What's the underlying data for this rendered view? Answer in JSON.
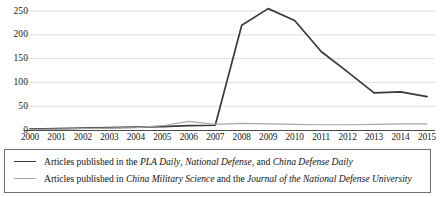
{
  "chart_data": {
    "type": "line",
    "title": "",
    "subtitle": "",
    "xlabel": "",
    "ylabel": "",
    "x": [
      2000,
      2001,
      2002,
      2003,
      2004,
      2005,
      2006,
      2007,
      2008,
      2009,
      2010,
      2011,
      2012,
      2013,
      2014,
      2015
    ],
    "categories": [
      "2000",
      "2001",
      "2002",
      "2003",
      "2004",
      "2005",
      "2006",
      "2007",
      "2008",
      "2009",
      "2010",
      "2011",
      "2012",
      "2013",
      "2014",
      "2015"
    ],
    "series": [
      {
        "name": "Articles published in the PLA Daily, National Defense, and China Defense Daily",
        "color": "#3a3a3a",
        "values": [
          2,
          3,
          4,
          5,
          6,
          7,
          9,
          10,
          220,
          255,
          230,
          165,
          122,
          78,
          80,
          70
        ]
      },
      {
        "name": "Articles published in China Military Science and the Journal of the National Defense University",
        "color": "#a8a8a8",
        "values": [
          1,
          2,
          3,
          4,
          5,
          9,
          18,
          12,
          14,
          13,
          12,
          11,
          11,
          12,
          13,
          13
        ]
      }
    ],
    "xlim": [
      2000,
      2015
    ],
    "ylim": [
      0,
      260
    ],
    "yticks": [
      0,
      50,
      100,
      150,
      200,
      250
    ],
    "ytick_labels": [
      "0",
      "50",
      "100",
      "150",
      "200",
      "250"
    ],
    "grid": true,
    "grid_axis": "y",
    "grid_color": "#d5d5d5",
    "legend_position": "below-plot",
    "axis_color": "#3a3a3a"
  },
  "legend": {
    "entries": [
      {
        "swatch": "series-primary",
        "icon": "line-swatch-icon",
        "parts": [
          {
            "text": "Articles published in the ",
            "italic": false
          },
          {
            "text": "PLA Daily",
            "italic": true
          },
          {
            "text": ", ",
            "italic": false
          },
          {
            "text": "National Defense",
            "italic": true
          },
          {
            "text": ", and ",
            "italic": false
          },
          {
            "text": "China Defense Daily",
            "italic": true
          }
        ]
      },
      {
        "swatch": "series-secondary",
        "icon": "line-swatch-icon",
        "parts": [
          {
            "text": "Articles published in ",
            "italic": false
          },
          {
            "text": "China Military Science",
            "italic": true
          },
          {
            "text": " and the ",
            "italic": false
          },
          {
            "text": "Journal of the National Defense University",
            "italic": true
          }
        ]
      }
    ]
  }
}
